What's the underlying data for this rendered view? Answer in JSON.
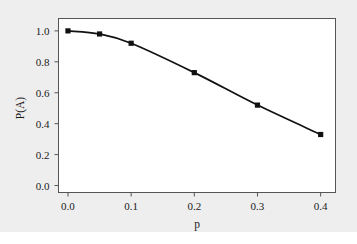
{
  "figure": {
    "background_color": "#eeeeee",
    "panel_color": "#ffffff",
    "frame_color": "#555555"
  },
  "chart_data": {
    "type": "line",
    "title": "",
    "xlabel": "p",
    "ylabel": "P(A)",
    "xlim": [
      -0.015,
      0.4235
    ],
    "ylim": [
      -0.045,
      1.08
    ],
    "grid": false,
    "legend": null,
    "line_color": "#111111",
    "marker": "square",
    "marker_color": "#111111",
    "x": [
      0.0,
      0.05,
      0.1,
      0.2,
      0.3,
      0.4
    ],
    "values": [
      1.0,
      0.98,
      0.92,
      0.73,
      0.52,
      0.33
    ],
    "series": [
      {
        "name": "P(A)",
        "x": [
          0.0,
          0.05,
          0.1,
          0.2,
          0.3,
          0.4
        ],
        "values": [
          1.0,
          0.98,
          0.92,
          0.73,
          0.52,
          0.33
        ]
      }
    ],
    "xticks": [
      0.0,
      0.1,
      0.2,
      0.3,
      0.4
    ],
    "xtick_labels": [
      "0.0",
      "0.1",
      "0.2",
      "0.3",
      "0.4"
    ],
    "yticks": [
      0.0,
      0.2,
      0.4,
      0.6,
      0.8,
      1.0
    ],
    "ytick_labels": [
      "0.0",
      "0.2",
      "0.4",
      "0.6",
      "0.8",
      "1.0"
    ]
  }
}
